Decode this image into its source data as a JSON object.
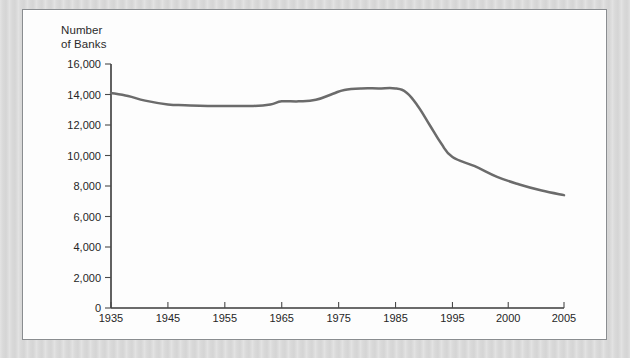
{
  "figure": {
    "outer_background_color": "#d9d9d9",
    "panel_background_color": "#fdfdfd",
    "panel_border_color": "#8a8d90"
  },
  "chart_data": {
    "type": "line",
    "title_line_1": "Number",
    "title_line_2": "of Banks",
    "xlabel": "",
    "ylabel": "Number of Banks",
    "grid": false,
    "legend": "none",
    "line_color": "#6b6b6b",
    "line_width": 2.5,
    "ylim": [
      0,
      16000
    ],
    "y_ticks": [
      0,
      2000,
      4000,
      6000,
      8000,
      10000,
      12000,
      14000,
      16000
    ],
    "y_tick_labels": [
      "0",
      "2,000",
      "4,000",
      "6,000",
      "8,000",
      "10,000",
      "12,000",
      "14,000",
      "16,000"
    ],
    "xlim": [
      1935,
      2005
    ],
    "x_ticks": [
      1935,
      1945,
      1955,
      1965,
      1975,
      1985,
      1995,
      2000,
      2005
    ],
    "x_tick_labels": [
      "1935",
      "1945",
      "1955",
      "1965",
      "1975",
      "1985",
      "1995",
      "2000",
      "2005"
    ],
    "x_axis_note": "non-uniform tick spacing: decades to 1995, then 5-year steps",
    "x": [
      1935,
      1938,
      1941,
      1945,
      1948,
      1952,
      1956,
      1960,
      1963,
      1965,
      1968,
      1971,
      1974,
      1976,
      1979,
      1982,
      1985,
      1987,
      1989,
      1991,
      1993,
      1995,
      1997,
      1999,
      2001,
      2003,
      2005
    ],
    "values": [
      14100,
      13900,
      13600,
      13350,
      13300,
      13250,
      13250,
      13250,
      13350,
      13550,
      13550,
      13650,
      14050,
      14300,
      14400,
      14400,
      14400,
      14100,
      13200,
      12000,
      10800,
      9900,
      9300,
      8600,
      8100,
      7700,
      7400
    ],
    "series": [
      {
        "name": "Number of Banks",
        "values": [
          14100,
          13900,
          13600,
          13350,
          13300,
          13250,
          13250,
          13250,
          13350,
          13550,
          13550,
          13650,
          14050,
          14300,
          14400,
          14400,
          14400,
          14100,
          13200,
          12000,
          10800,
          9900,
          9300,
          8600,
          8100,
          7700,
          7400
        ]
      }
    ]
  }
}
